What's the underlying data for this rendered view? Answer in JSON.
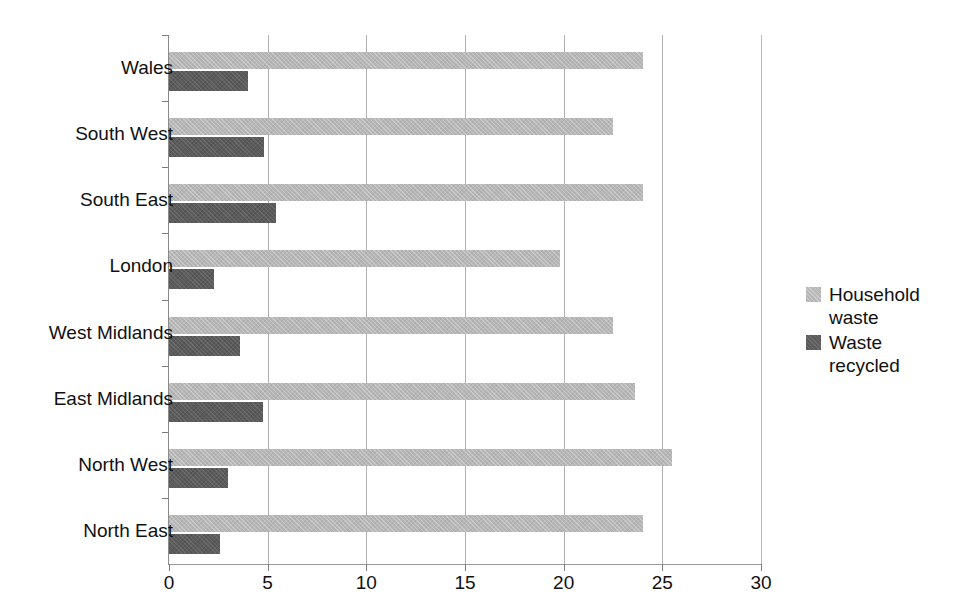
{
  "chart_data": {
    "type": "bar",
    "orientation": "horizontal",
    "title": "",
    "subtitle": "",
    "xlabel": "",
    "ylabel": "",
    "categories": [
      "Wales",
      "South West",
      "South East",
      "London",
      "West Midlands",
      "East Midlands",
      "North West",
      "North East"
    ],
    "series": [
      {
        "name": "Household waste",
        "color": "#b6b6b6",
        "values": [
          24.0,
          22.5,
          24.0,
          19.8,
          22.5,
          23.6,
          25.5,
          24.0
        ]
      },
      {
        "name": "Waste recycled",
        "color": "#5b5b5b",
        "values": [
          4.0,
          4.8,
          5.4,
          2.3,
          3.6,
          4.75,
          3.0,
          2.6
        ]
      }
    ],
    "xlim": [
      0,
      30
    ],
    "xticks": [
      0,
      5,
      10,
      15,
      20,
      25,
      30
    ],
    "xtick_labels": [
      "0",
      "5",
      "10",
      "15",
      "20",
      "25",
      "30"
    ],
    "grid": "vertical",
    "legend_position": "right"
  },
  "legend": {
    "entries": [
      {
        "label": "Household waste"
      },
      {
        "label": "Waste recycled"
      }
    ]
  },
  "axes": {
    "x_tick_labels": [
      "0",
      "5",
      "10",
      "15",
      "20",
      "25",
      "30"
    ],
    "y_category_labels": [
      "Wales",
      "South West",
      "South East",
      "London",
      "West Midlands",
      "East Midlands",
      "North West",
      "North East"
    ]
  }
}
